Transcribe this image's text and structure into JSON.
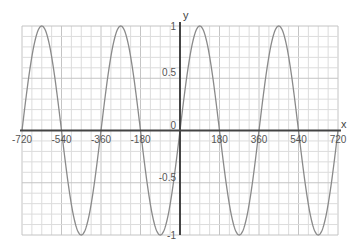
{
  "chart_data": {
    "type": "line",
    "title": "",
    "xlabel": "x",
    "ylabel": "y",
    "function": "y = sin(x)",
    "xlim": [
      -720,
      720
    ],
    "ylim": [
      -1,
      1
    ],
    "x_ticks": [
      -720,
      -540,
      -360,
      -180,
      0,
      180,
      360,
      540,
      720
    ],
    "x_tick_labels": [
      "-720",
      "-540",
      "-360",
      "-180",
      "0",
      "180",
      "360",
      "540",
      "720"
    ],
    "y_ticks": [
      -1,
      -0.5,
      0,
      0.5,
      1
    ],
    "y_tick_labels": [
      "-1",
      "-0.5",
      "0",
      "0.5",
      "1"
    ],
    "grid": true,
    "grid_minor_x_step": 45,
    "grid_minor_y_step": 0.1,
    "series": [
      {
        "name": "sin(x)",
        "color": "#8a8a8a",
        "x": [
          -720,
          -630,
          -540,
          -450,
          -360,
          -270,
          -180,
          -90,
          0,
          90,
          180,
          270,
          360,
          450,
          540,
          630,
          720
        ],
        "values": [
          0,
          1,
          0,
          -1,
          0,
          1,
          0,
          -1,
          0,
          1,
          0,
          -1,
          0,
          1,
          0,
          -1,
          0
        ]
      }
    ],
    "legend": null
  },
  "colors": {
    "grid_minor": "#dcdcdc",
    "grid_major": "#c4c4c4",
    "axis": "#444444",
    "curve": "#8a8a8a"
  }
}
